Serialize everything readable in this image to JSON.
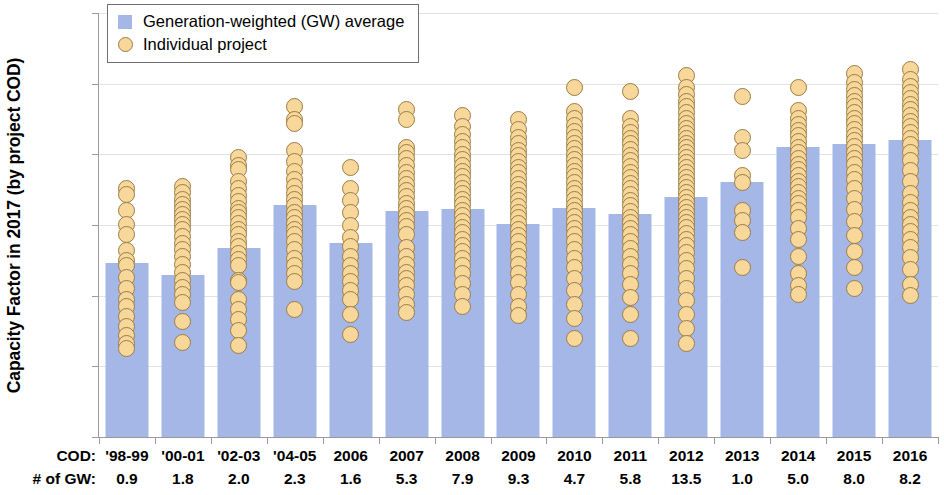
{
  "chart_data": {
    "type": "scatter",
    "title": "",
    "xlabel": "",
    "ylabel": "Capacity Factor in 2017 (by project COD)",
    "ylim": [
      0,
      0.6
    ],
    "ytick_labels": [
      "0%",
      "10%",
      "20%",
      "30%",
      "40%",
      "50%",
      "60%"
    ],
    "ytick_values": [
      0,
      10,
      20,
      30,
      40,
      50,
      60
    ],
    "grid": true,
    "legend_position": "top-left",
    "categories": [
      "'98-99",
      "'00-01",
      "'02-03",
      "'04-05",
      "2006",
      "2007",
      "2008",
      "2009",
      "2010",
      "2011",
      "2012",
      "2013",
      "2014",
      "2015",
      "2016"
    ],
    "series": [
      {
        "name": "Generation-weighted (GW) average",
        "type": "bar",
        "color": "#a4b7e6",
        "values": [
          24.6,
          22.9,
          26.8,
          32.9,
          27.5,
          32.0,
          32.3,
          30.1,
          32.4,
          31.5,
          34.0,
          36.1,
          41.0,
          41.4,
          42.0
        ]
      },
      {
        "name": "Individual project",
        "type": "scatter",
        "color": "#f8d79a",
        "points": [
          [
            35.2,
            34.3,
            32.0,
            30.1,
            28.7,
            26.4,
            25.0,
            24.2,
            22.6,
            21.0,
            19.5,
            18.5,
            17.0,
            15.6,
            14.4,
            13.3,
            12.5
          ],
          [
            35.4,
            34.6,
            33.6,
            32.9,
            32.2,
            31.5,
            30.8,
            30.1,
            29.4,
            28.4,
            27.4,
            26.5,
            25.5,
            24.4,
            23.3,
            22.2,
            21.2,
            20.2,
            19.0,
            16.4,
            13.4
          ],
          [
            39.6,
            38.4,
            37.9,
            36.1,
            35.1,
            34.2,
            33.3,
            32.4,
            31.7,
            31.0,
            30.2,
            29.4,
            28.6,
            27.7,
            26.9,
            26.0,
            25.1,
            24.2,
            22.2,
            21.9,
            19.5,
            18.1,
            16.6,
            15.1,
            13.0
          ],
          [
            46.8,
            45.0,
            44.3,
            40.5,
            39.0,
            37.6,
            36.5,
            35.5,
            34.5,
            33.6,
            32.7,
            31.8,
            31.0,
            30.2,
            29.4,
            28.6,
            27.6,
            26.5,
            25.3,
            24.3,
            23.2,
            22.0,
            18.1
          ],
          [
            38.1,
            35.2,
            33.5,
            31.7,
            29.9,
            28.3,
            27.0,
            25.6,
            24.3,
            23.1,
            22.0,
            20.8,
            19.4,
            17.4,
            14.5
          ],
          [
            46.4,
            45.0,
            41.0,
            40.3,
            39.4,
            38.4,
            37.5,
            36.6,
            35.7,
            34.9,
            34.0,
            33.1,
            32.3,
            31.5,
            30.7,
            29.8,
            28.6,
            26.8,
            25.6,
            24.4,
            23.3,
            22.4,
            21.5,
            20.2,
            18.7,
            17.6
          ],
          [
            45.5,
            44.0,
            42.8,
            41.8,
            40.9,
            40.0,
            39.2,
            38.4,
            37.6,
            36.8,
            36.0,
            35.2,
            34.4,
            33.6,
            32.9,
            32.1,
            31.3,
            30.5,
            29.7,
            28.9,
            28.0,
            27.1,
            26.2,
            25.2,
            24.2,
            23.1,
            21.7,
            20.1,
            18.4
          ],
          [
            44.9,
            43.5,
            42.4,
            41.5,
            40.6,
            39.8,
            39.0,
            38.2,
            37.4,
            36.6,
            35.8,
            35.0,
            34.2,
            33.4,
            32.6,
            31.8,
            31.0,
            30.2,
            29.4,
            28.5,
            27.6,
            26.6,
            25.5,
            24.4,
            23.2,
            21.8,
            20.2,
            18.5,
            17.2
          ],
          [
            49.4,
            46.1,
            45.1,
            44.1,
            43.2,
            42.4,
            41.6,
            40.8,
            40.0,
            39.2,
            38.4,
            37.6,
            36.8,
            36.0,
            35.2,
            34.4,
            33.6,
            32.8,
            32.0,
            31.2,
            30.4,
            29.5,
            28.6,
            27.6,
            26.5,
            25.3,
            24.0,
            22.5,
            20.8,
            18.7,
            16.8,
            13.9
          ],
          [
            48.9,
            45.1,
            44.0,
            43.1,
            42.3,
            41.5,
            40.7,
            39.9,
            39.1,
            38.3,
            37.5,
            36.7,
            35.9,
            35.1,
            34.3,
            33.5,
            32.7,
            31.9,
            31.1,
            30.3,
            29.5,
            28.6,
            27.7,
            26.7,
            25.6,
            24.4,
            23.1,
            21.6,
            19.8,
            17.3,
            13.9
          ],
          [
            51.1,
            49.5,
            48.4,
            47.5,
            46.7,
            45.9,
            45.1,
            44.4,
            43.7,
            43.0,
            42.3,
            41.6,
            40.9,
            40.2,
            39.5,
            38.8,
            38.1,
            37.4,
            36.7,
            36.0,
            35.3,
            34.6,
            33.9,
            33.2,
            32.5,
            31.8,
            31.1,
            30.4,
            29.6,
            28.8,
            28.0,
            27.1,
            26.1,
            25.0,
            23.8,
            22.5,
            21.0,
            19.3,
            17.4,
            15.4,
            13.2
          ],
          [
            48.2,
            42.4,
            40.5,
            37.0,
            36.0,
            32.1,
            30.7,
            28.9,
            24.0
          ],
          [
            49.4,
            46.2,
            45.1,
            44.2,
            43.4,
            42.6,
            41.8,
            41.0,
            40.2,
            39.4,
            38.6,
            37.8,
            37.0,
            36.2,
            35.4,
            34.6,
            33.8,
            33.0,
            32.1,
            31.0,
            29.5,
            27.9,
            25.6,
            23.2,
            21.4,
            20.2
          ],
          [
            51.5,
            50.2,
            49.2,
            48.3,
            47.5,
            46.7,
            45.9,
            45.1,
            44.3,
            43.5,
            42.7,
            41.9,
            41.1,
            40.3,
            39.4,
            38.5,
            37.5,
            36.4,
            35.2,
            33.8,
            32.2,
            30.5,
            28.5,
            26.3,
            24.0,
            21.0
          ],
          [
            52.0,
            50.6,
            49.6,
            48.7,
            47.9,
            47.1,
            46.3,
            45.5,
            44.7,
            43.9,
            43.1,
            42.3,
            41.4,
            40.3,
            39.1,
            37.7,
            36.1,
            34.5,
            33.2,
            32.1,
            31.1,
            30.1,
            29.1,
            28.0,
            26.8,
            25.4,
            23.7,
            21.6,
            20.0
          ]
        ]
      }
    ],
    "row_labels": {
      "cod": "COD:",
      "gw": "# of GW:"
    },
    "cod_values": [
      "'98-99",
      "'00-01",
      "'02-03",
      "'04-05",
      "2006",
      "2007",
      "2008",
      "2009",
      "2010",
      "2011",
      "2012",
      "2013",
      "2014",
      "2015",
      "2016"
    ],
    "gw_values": [
      "0.9",
      "1.8",
      "2.0",
      "2.3",
      "1.6",
      "5.3",
      "7.9",
      "9.3",
      "4.7",
      "5.8",
      "13.5",
      "1.0",
      "5.0",
      "8.0",
      "8.2"
    ]
  },
  "legend": {
    "items": [
      {
        "label": "Generation-weighted (GW) average",
        "marker": "square",
        "color": "#a4b7e6"
      },
      {
        "label": "Individual project",
        "marker": "circle",
        "color": "#f8d79a"
      }
    ]
  }
}
